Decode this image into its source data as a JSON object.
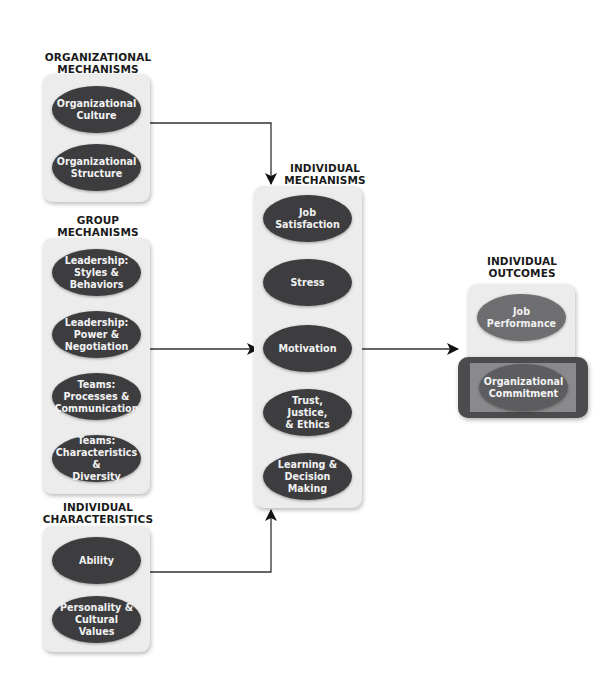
{
  "groups": [
    {
      "id": "organizational-mechanisms",
      "heading": [
        "ORGANIZATIONAL",
        "MECHANISMS"
      ],
      "items": [
        {
          "label": "Organizational Culture"
        },
        {
          "label": "Organizational Structure"
        }
      ]
    },
    {
      "id": "group-mechanisms",
      "heading": [
        "GROUP",
        "MECHANISMS"
      ],
      "items": [
        {
          "label": "Leadership: Styles & Behaviors"
        },
        {
          "label": "Leadership: Power & Negotiation"
        },
        {
          "label": "Teams: Processes & Communication"
        },
        {
          "label": "Teams: Characteristics & Diversity"
        }
      ]
    },
    {
      "id": "individual-characteristics",
      "heading": [
        "INDIVIDUAL",
        "CHARACTERISTICS"
      ],
      "items": [
        {
          "label": "Ability"
        },
        {
          "label": "Personality & Cultural Values"
        }
      ]
    },
    {
      "id": "individual-mechanisms",
      "heading": [
        "INDIVIDUAL",
        "MECHANISMS"
      ],
      "items": [
        {
          "label": "Job Satisfaction"
        },
        {
          "label": "Stress"
        },
        {
          "label": "Motivation"
        },
        {
          "label": "Trust, Justice, & Ethics"
        },
        {
          "label": "Learning & Decision Making"
        }
      ]
    },
    {
      "id": "individual-outcomes",
      "heading": [
        "INDIVIDUAL",
        "OUTCOMES"
      ],
      "items": [
        {
          "label": "Job Performance"
        },
        {
          "label": "Organizational Commitment",
          "highlighted": true
        }
      ]
    }
  ],
  "lines": {
    "org_culture": [
      "Organizational",
      "Culture"
    ],
    "org_structure": [
      "Organizational",
      "Structure"
    ],
    "lead_styles": [
      "Leadership:",
      "Styles &",
      "Behaviors"
    ],
    "lead_power": [
      "Leadership:",
      "Power &",
      "Negotiation"
    ],
    "teams_proc": [
      "Teams:",
      "Processes &",
      "Communication"
    ],
    "teams_char": [
      "Teams:",
      "Characteristics &",
      "Diversity"
    ],
    "ability": [
      "Ability"
    ],
    "personality": [
      "Personality &",
      "Cultural Values"
    ],
    "job_sat": [
      "Job",
      "Satisfaction"
    ],
    "stress": [
      "Stress"
    ],
    "motivation": [
      "Motivation"
    ],
    "trust": [
      "Trust, Justice,",
      "& Ethics"
    ],
    "learning": [
      "Learning &",
      "Decision Making"
    ],
    "job_perf": [
      "Job",
      "Performance"
    ],
    "org_commit": [
      "Organizational",
      "Commitment"
    ]
  },
  "colors": {
    "oval_dark": "#3d3d40",
    "oval_outcome": "#6e6e71",
    "highlight_frame": "#4c4c4f",
    "highlight_fill": "#8a8a8c",
    "panel": "#ececec",
    "arrow": "#111111"
  }
}
